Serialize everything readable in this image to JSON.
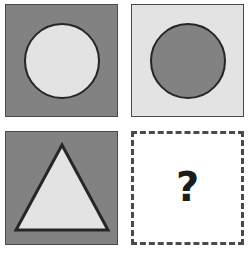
{
  "puzzle": {
    "type": "visual-analogy-matrix",
    "rows": 2,
    "columns": 2,
    "colors": {
      "dark_gray": "#828282",
      "light_gray": "#e3e3e3",
      "outline": "#262626",
      "panel_border": "#4a4a4a",
      "dashed_border": "#4a4a4a",
      "question_color": "#1c1c1c",
      "background": "#ffffff"
    },
    "cells": [
      {
        "position": "top-left",
        "panel_fill": "dark",
        "shape": "circle",
        "shape_fill": "light",
        "label": "dark square with light circle"
      },
      {
        "position": "top-right",
        "panel_fill": "light",
        "shape": "circle",
        "shape_fill": "dark",
        "label": "light square with dark circle"
      },
      {
        "position": "bottom-left",
        "panel_fill": "dark",
        "shape": "triangle",
        "shape_fill": "light",
        "label": "dark square with light triangle"
      },
      {
        "position": "bottom-right",
        "panel_fill": "none",
        "shape": "none",
        "shape_fill": "none",
        "label": "missing answer cell",
        "border_style": "dashed",
        "question_text": "?"
      }
    ]
  }
}
